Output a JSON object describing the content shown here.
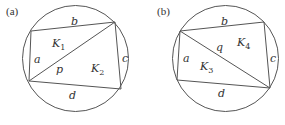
{
  "figures": [
    {
      "tag": "(a)",
      "circle": {
        "cx": 75.5,
        "cy": 58.5,
        "r": 53
      },
      "vertices": {
        "tl": [
          31,
          31
        ],
        "tr": [
          115,
          22
        ],
        "br": [
          121,
          89
        ],
        "bl": [
          29,
          81
        ]
      },
      "diagonal": "tr-bl",
      "sides": {
        "a": "a",
        "b": "b",
        "c": "c",
        "d": "d"
      },
      "diagonal_label": "p",
      "regions": [
        {
          "name": "K",
          "sub": "1"
        },
        {
          "name": "K",
          "sub": "2"
        }
      ]
    },
    {
      "tag": "(b)",
      "circle": {
        "cx": 225.5,
        "cy": 58.5,
        "r": 53
      },
      "vertices": {
        "tl": [
          180,
          31
        ],
        "tr": [
          264,
          22
        ],
        "br": [
          270,
          88
        ],
        "bl": [
          177,
          80
        ]
      },
      "diagonal": "tl-br",
      "sides": {
        "a": "a",
        "b": "b",
        "c": "c",
        "d": "d"
      },
      "diagonal_label": "q",
      "regions": [
        {
          "name": "K",
          "sub": "3"
        },
        {
          "name": "K",
          "sub": "4"
        }
      ]
    }
  ],
  "colors": {
    "stroke": "#555555",
    "text": "#333333",
    "background": "#ffffff"
  }
}
